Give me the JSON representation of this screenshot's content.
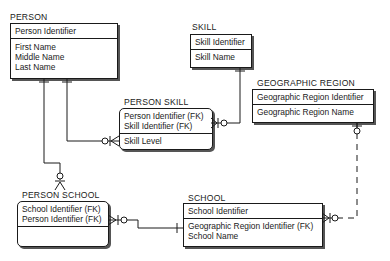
{
  "entities": {
    "person": {
      "name": "PERSON",
      "key_attributes": [
        "Person Identifier"
      ],
      "attributes": [
        "First Name",
        "Middle Name",
        "Last Name"
      ]
    },
    "skill": {
      "name": "SKILL",
      "key_attributes": [
        "Skill Identifier"
      ],
      "attributes": [
        "Skill Name"
      ]
    },
    "geographic_region": {
      "name": "GEOGRAPHIC REGION",
      "key_attributes": [
        "Geographic Region Identifier"
      ],
      "attributes": [
        "Geographic Region Name"
      ]
    },
    "person_skill": {
      "name": "PERSON SKILL",
      "key_attributes": [
        "Person Identifier (FK)",
        "Skill Identifier (FK)"
      ],
      "attributes": [
        "Skill Level"
      ]
    },
    "person_school": {
      "name": "PERSON SCHOOL",
      "key_attributes": [
        "School Identifier (FK)",
        "Person Identifier (FK)"
      ],
      "attributes": []
    },
    "school": {
      "name": "SCHOOL",
      "key_attributes": [
        "School Identifier"
      ],
      "attributes": [
        "Geographic Region Identifier (FK)",
        "School Name"
      ]
    }
  },
  "relationships": [
    {
      "from": "PERSON",
      "to": "PERSON SKILL",
      "from_card": "one-and-only-one",
      "to_card": "zero-or-many",
      "line": "solid"
    },
    {
      "from": "PERSON",
      "to": "PERSON SCHOOL",
      "from_card": "one-and-only-one",
      "to_card": "zero-or-many",
      "line": "solid"
    },
    {
      "from": "SKILL",
      "to": "PERSON SKILL",
      "from_card": "one-and-only-one",
      "to_card": "zero-or-many",
      "line": "solid"
    },
    {
      "from": "SCHOOL",
      "to": "PERSON SCHOOL",
      "from_card": "one-and-only-one",
      "to_card": "zero-or-many",
      "line": "solid"
    },
    {
      "from": "GEOGRAPHIC REGION",
      "to": "SCHOOL",
      "from_card": "zero-or-one",
      "to_card": "zero-or-many",
      "line": "dashed"
    }
  ],
  "colors": {
    "line": "#1a1a1a",
    "shadow": "#555555",
    "background": "#ffffff"
  }
}
